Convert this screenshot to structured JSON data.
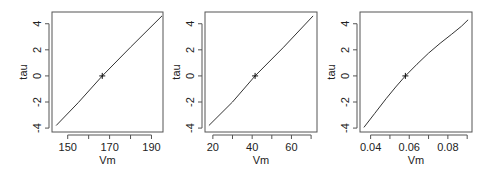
{
  "figure": {
    "background": "#ffffff",
    "line_color": "#333333",
    "axis_color": "#555555"
  },
  "chart_data": [
    {
      "type": "line",
      "title": "",
      "xlabel": "Vm",
      "ylabel": "tau",
      "xlim": [
        142.5,
        195.5
      ],
      "ylim": [
        -4.3,
        4.9
      ],
      "xticks": [
        150,
        160,
        170,
        180,
        190
      ],
      "xtick_labels": [
        "150",
        "",
        "170",
        "",
        "190"
      ],
      "yticks": [
        -4,
        -2,
        0,
        2,
        4
      ],
      "ytick_labels": [
        "-4",
        "-2",
        "0",
        "2",
        "4"
      ],
      "grid": false,
      "series": [
        {
          "name": "profile",
          "x": [
            144.5,
            155,
            166.5,
            180,
            195
          ],
          "y": [
            -3.8,
            -2.05,
            0,
            2.2,
            4.6
          ]
        }
      ],
      "marker": {
        "x": 166.5,
        "y": 0,
        "symbol": "+"
      },
      "box": {
        "left": 52,
        "top": 12,
        "right": 163,
        "bottom": 132
      }
    },
    {
      "type": "line",
      "title": "",
      "xlabel": "Vm",
      "ylabel": "tau",
      "xlim": [
        16,
        73
      ],
      "ylim": [
        -4.3,
        4.9
      ],
      "xticks": [
        20,
        30,
        40,
        50,
        60,
        70
      ],
      "xtick_labels": [
        "20",
        "",
        "40",
        "",
        "60",
        ""
      ],
      "yticks": [
        -4,
        -2,
        0,
        2,
        4
      ],
      "ytick_labels": [
        "-4",
        "-2",
        "0",
        "2",
        "4"
      ],
      "grid": false,
      "series": [
        {
          "name": "profile",
          "x": [
            18,
            30,
            41.5,
            56,
            71
          ],
          "y": [
            -3.8,
            -2.0,
            0,
            2.2,
            4.6
          ]
        }
      ],
      "marker": {
        "x": 41.5,
        "y": 0,
        "symbol": "+"
      },
      "box": {
        "left": 205,
        "top": 12,
        "right": 317,
        "bottom": 132
      }
    },
    {
      "type": "line",
      "title": "",
      "xlabel": "Vm",
      "ylabel": "tau",
      "xlim": [
        0.0345,
        0.0925
      ],
      "ylim": [
        -4.3,
        4.9
      ],
      "xticks": [
        0.04,
        0.05,
        0.06,
        0.07,
        0.08,
        0.09
      ],
      "xtick_labels": [
        "0.04",
        "",
        "0.06",
        "",
        "0.08",
        ""
      ],
      "yticks": [
        -4,
        -2,
        0,
        2,
        4
      ],
      "ytick_labels": [
        "-4",
        "-2",
        "0",
        "2",
        "4"
      ],
      "grid": false,
      "series": [
        {
          "name": "profile",
          "x": [
            0.0365,
            0.042,
            0.048,
            0.053,
            0.058,
            0.064,
            0.07,
            0.076,
            0.082,
            0.087,
            0.0905
          ],
          "y": [
            -3.95,
            -2.9,
            -1.75,
            -0.85,
            0,
            0.9,
            1.75,
            2.5,
            3.2,
            3.8,
            4.3
          ]
        }
      ],
      "marker": {
        "x": 0.058,
        "y": 0,
        "symbol": "+"
      },
      "box": {
        "left": 360,
        "top": 12,
        "right": 472,
        "bottom": 132
      }
    }
  ]
}
